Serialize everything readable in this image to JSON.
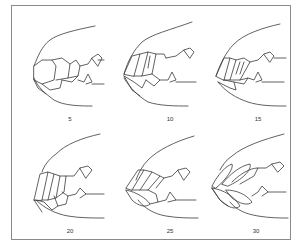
{
  "figure": {
    "stroke_color": "#3a3a3a",
    "border_color": "#8a8a8a",
    "panels": [
      {
        "label": "5"
      },
      {
        "label": "10"
      },
      {
        "label": "15"
      },
      {
        "label": "20"
      },
      {
        "label": "25"
      },
      {
        "label": "30"
      }
    ]
  }
}
